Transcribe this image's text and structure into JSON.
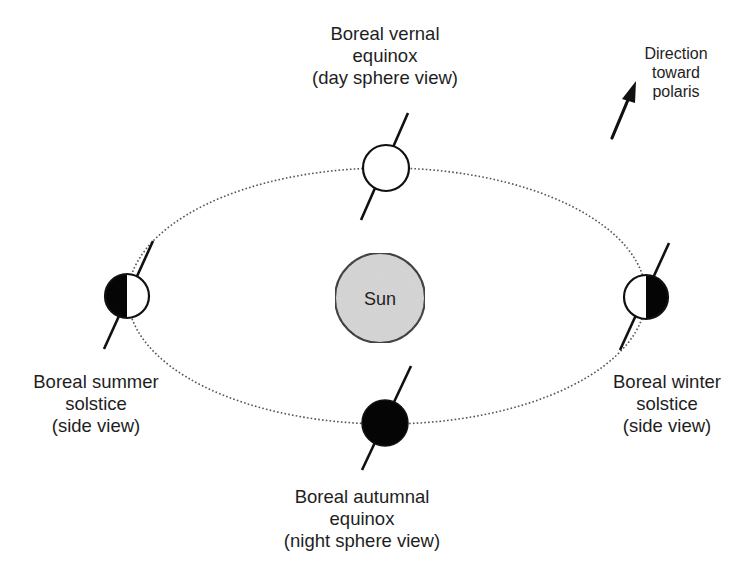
{
  "diagram": {
    "sun": {
      "label": "Sun",
      "fill_color": "#d6d6d6"
    },
    "positions": [
      {
        "id": "vernal",
        "name": "Boreal vernal equinox",
        "lines": [
          "Boreal vernal",
          "equinox",
          "(day sphere view)"
        ],
        "view": "day sphere view",
        "shading": "all-lit"
      },
      {
        "id": "summer",
        "name": "Boreal summer solstice",
        "lines": [
          "Boreal summer",
          "solstice",
          "(side view)"
        ],
        "view": "side view",
        "shading": "left-half-dark"
      },
      {
        "id": "winter",
        "name": "Boreal winter solstice",
        "lines": [
          "Boreal winter",
          "solstice",
          "(side view)"
        ],
        "view": "side view",
        "shading": "right-half-dark"
      },
      {
        "id": "autumnal",
        "name": "Boreal autumnal equinox",
        "lines": [
          "Boreal autumnal",
          "equinox",
          "(night sphere view)"
        ],
        "view": "night sphere view",
        "shading": "all-dark"
      }
    ],
    "polaris": {
      "lines": [
        "Direction",
        "toward",
        "polaris"
      ],
      "icon": "arrow-up-right-icon"
    },
    "colors": {
      "ink": "#111111",
      "orbit": "#555555",
      "lit": "#ffffff",
      "dark": "#050505"
    }
  }
}
